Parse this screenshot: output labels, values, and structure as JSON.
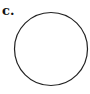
{
  "figure": {
    "label": "c.",
    "shape": "circle",
    "circle": {
      "cx": 51,
      "cy": 49,
      "r": 36.5,
      "stroke": "#222222",
      "stroke_width": 1.2,
      "fill": "none"
    }
  }
}
